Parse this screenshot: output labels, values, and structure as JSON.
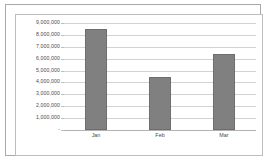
{
  "chart_data": {
    "type": "bar",
    "title": "",
    "subtitle": "",
    "xlabel": "",
    "ylabel": "",
    "categories": [
      "Jan",
      "Feb",
      "Mar"
    ],
    "values": [
      8500000,
      4500000,
      6400000
    ],
    "series": [
      {
        "name": "",
        "values": [
          8500000,
          4500000,
          6400000
        ]
      }
    ],
    "ylim": [
      0,
      9000000
    ],
    "ytick_values": [
      0,
      1000000,
      2000000,
      3000000,
      4000000,
      5000000,
      6000000,
      7000000,
      8000000,
      9000000
    ],
    "ytick_labels": [
      "-",
      "1,000,000",
      "2,000,000",
      "3,000,000",
      "4,000,000",
      "5,000,000",
      "6,000,000",
      "7,000,000",
      "8,000,000",
      "9,000,000"
    ],
    "grid": true,
    "grid_axis": "y",
    "legend": false,
    "legend_position": "none",
    "annotations": []
  },
  "style": {
    "bar_color": "#808080",
    "bar_border_color": "#6e6e6e",
    "gridline_color": "#d2d2d2",
    "baseline_color": "#b0b0b0",
    "axis_text_color": "#4a4a4a",
    "plot_background": "#ffffff",
    "outer_frame_color": "#a8a8a8",
    "chart_frame_color": "#bdbdbd"
  }
}
